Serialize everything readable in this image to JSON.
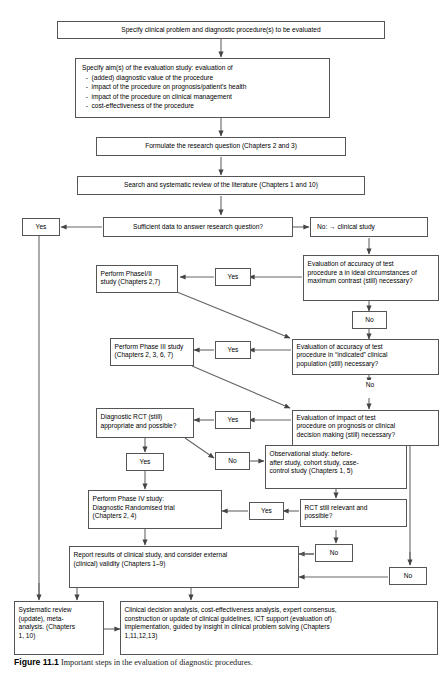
{
  "figure": {
    "caption_number": "Figure 11.1",
    "caption_text": "Important steps in the evaluation of diagnostic procedures."
  },
  "colors": {
    "box_border": "#555555",
    "arrow": "#444444",
    "background": "#ffffff",
    "text": "#000000"
  },
  "nodes": {
    "specify_problem": "Specify clinical problem and diagnostic procedure(s) to be evaluated",
    "specify_aims": "Specify aim(s) of the evaluation study: evaluation of\n  -  (added) diagnostic value of the procedure\n  -  impact of the procedure on prognosis/patient's health\n  -  impact of the procedure on clinical management\n  -  cost-effectiveness of the procedure",
    "formulate_question": "Formulate the research question (Chapters 2 and 3)",
    "search_review": "Search and systematic review of the literature (Chapters 1 and 10)",
    "sufficient_data": "Sufficient data to answer research question?",
    "yes_left_top": "Yes",
    "no_clinical_study": "No:  →  clinical study",
    "eval_accuracy_ideal": "Evaluation of accuracy of test\nprocedure a in ideal circumstances of\nmaximum contrast (still) necessary?",
    "yes_phase12": "Yes",
    "perform_phase12": "Perform PhaseI/II\nstudy (Chapters 2,7)",
    "no_after_ideal": "No",
    "eval_accuracy_indicated": "Evaluation of accuracy of test\nprocedure in “indicated” clinical\npopulation (still) necessary?",
    "yes_phase3": "Yes",
    "perform_phase3": "Perform Phase III study\n(Chapters 2, 3, 6, 7)",
    "no_after_indicated": "No",
    "eval_impact": "Evaluation of impact of test\nprocedure on prognosis or clinical\ndecision making (still) necessary?",
    "yes_rct": "Yes",
    "diagnostic_rct": "Diagnostic RCT (still)\nappropriate and possible?",
    "yes_rct_down": "Yes",
    "no_rct_right": "No",
    "observational_study": "Observational study: before-\nafter study, cohort study, case-\ncontrol study (Chapters 1, 5)",
    "rct_relevant": "RCT still relevant and\npossible?",
    "yes_phase4": "Yes",
    "perform_phase4": "Perform Phase IV study:\nDiagnostic Randomised trial\n(Chapters 2, 4)",
    "no_rct_relevant": "No",
    "no_far_right": "No",
    "report_results": "Report results of clinical study, and consider external\n(clinical) validity (Chapters 1–9)",
    "systematic_review": "Systematic review\n(update), meta-\nanalysis. (Chapters\n1, 10)",
    "clinical_decision": "Clinical decision analysis, cost-effectiveness analysis, expert consensus,\nconstruction or update of clinical guidelines, ICT support (evaluation of)\nimplementation, guided by insight in clinical problem solving (Chapters\n1,11,12,13)"
  }
}
